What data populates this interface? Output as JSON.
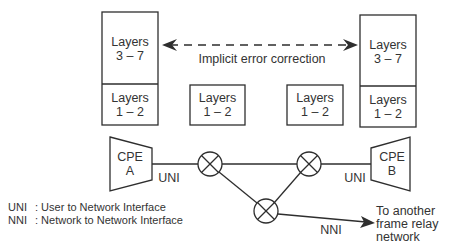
{
  "left_stack": {
    "upper": {
      "line1": "Layers",
      "line2": "3 – 7"
    },
    "lower": {
      "line1": "Layers",
      "line2": "1 – 2"
    }
  },
  "right_stack": {
    "upper": {
      "line1": "Layers",
      "line2": "3 – 7"
    },
    "lower": {
      "line1": "Layers",
      "line2": "1 – 2"
    }
  },
  "middle_boxes": [
    {
      "line1": "Layers",
      "line2": "1 – 2"
    },
    {
      "line1": "Layers",
      "line2": "1 – 2"
    }
  ],
  "arrow_label": "Implicit error correction",
  "cpe_a": {
    "line1": "CPE",
    "line2": "A"
  },
  "cpe_b": {
    "line1": "CPE",
    "line2": "B"
  },
  "interface_labels": {
    "uni_left": "UNI",
    "uni_right": "UNI",
    "nni": "NNI"
  },
  "destination": {
    "line1": "To another",
    "line2": "frame relay",
    "line3": "network"
  },
  "legend": [
    {
      "abbr": "UNI",
      "desc": ": User to Network Interface"
    },
    {
      "abbr": "NNI",
      "desc": ": Network to Network Interface"
    }
  ],
  "colors": {
    "stroke": "#2e2e2e",
    "background": "#ffffff"
  }
}
